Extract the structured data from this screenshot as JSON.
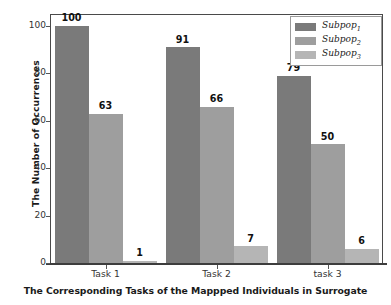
{
  "chart_data": {
    "type": "bar",
    "title": "",
    "xlabel": "The Corresponding Tasks of the Mappped Individuals in Surrogate",
    "ylabel": "The Number of Occurrences",
    "categories": [
      "Task 1",
      "Task 2",
      "task 3"
    ],
    "series": [
      {
        "name": "Subpop1",
        "legend_base": "Subpop",
        "legend_sub": "1",
        "values": [
          100,
          91,
          79
        ],
        "color": "#7a7a7a"
      },
      {
        "name": "Subpop2",
        "legend_base": "Subpop",
        "legend_sub": "2",
        "values": [
          63,
          66,
          50
        ],
        "color": "#9e9e9e"
      },
      {
        "name": "Subpop3",
        "legend_base": "Subpop",
        "legend_sub": "3",
        "values": [
          1,
          7,
          6
        ],
        "color": "#b5b5b5"
      }
    ],
    "ylim": [
      0,
      105
    ],
    "yticks": [
      0,
      20,
      40,
      60,
      80,
      100
    ],
    "ytick_labels": [
      "0",
      "20",
      "40",
      "60",
      "80",
      "100"
    ],
    "grid": false,
    "legend_position": "upper right",
    "bar_labels": [
      [
        "100",
        "63",
        "1"
      ],
      [
        "91",
        "66",
        "7"
      ],
      [
        "79",
        "50",
        "6"
      ]
    ]
  },
  "axes": {
    "y_title": "The Number of Occurrences",
    "x_title": "The Corresponding Tasks of the Mappped Individuals in Surrogate",
    "y_tick_labels": [
      "100",
      "80",
      "60",
      "40",
      "20",
      "0"
    ],
    "x_tick_labels": [
      "Task 1",
      "Task 2",
      "task 3"
    ]
  },
  "legend": {
    "entries": [
      {
        "label_base": "Subpop",
        "label_sub": "1"
      },
      {
        "label_base": "Subpop",
        "label_sub": "2"
      },
      {
        "label_base": "Subpop",
        "label_sub": "3"
      }
    ]
  },
  "colors": {
    "series1": "#7a7a7a",
    "series2": "#9e9e9e",
    "series3": "#b5b5b5",
    "axis": "#3d3d3d",
    "text": "#1a1a1a",
    "background": "#ffffff"
  }
}
